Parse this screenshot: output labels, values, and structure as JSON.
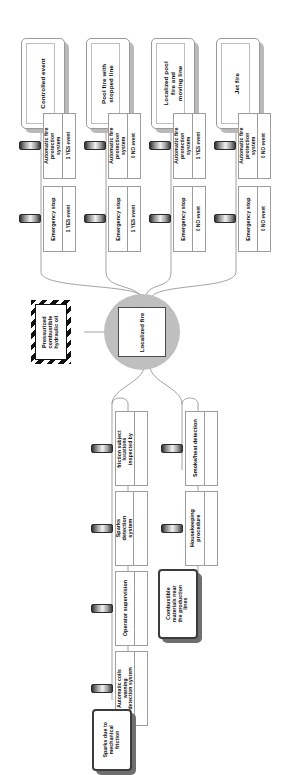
{
  "diagram": {
    "type": "bowtie-risk-diagram",
    "orientation": "rotated-90",
    "colors": {
      "top_event_circle": "#bfbfbf",
      "hazard_border": "#111111",
      "threat_fill": "#ffffff",
      "consequence_shadow": "#b9b9b9",
      "line": "#8a8a8a"
    }
  },
  "hazard": {
    "label": "Pressurized combustible hydraulic oil"
  },
  "top_event": {
    "label": "Localized fire"
  },
  "threats": [
    {
      "label": "Combustible materials near the production lines"
    },
    {
      "label": "Sparks due to mechanical friction"
    }
  ],
  "preventive_barriers": [
    {
      "label": "Mechanical friction subject locations inspected by operator"
    },
    {
      "label": "Smoke/heat detection"
    },
    {
      "label": "Sparks detection system"
    },
    {
      "label": "Housekeeping procedure"
    },
    {
      "label": "Operator supervision"
    },
    {
      "label": "Automatic coils warning detection system"
    }
  ],
  "consequences": [
    {
      "label": "Controlled event"
    },
    {
      "label": "Pool fire with stopped line"
    },
    {
      "label": "Localized pool fire and moving line"
    },
    {
      "label": "Jet fire"
    }
  ],
  "mitigative_barriers": [
    {
      "label": "Automatic fire protection system",
      "outcome": "1 YES event"
    },
    {
      "label": "Automatic fire protection system",
      "outcome": "0 NO event"
    },
    {
      "label": "Automatic fire protection system",
      "outcome": "1 YES event"
    },
    {
      "label": "Automatic fire protection system",
      "outcome": "0 NO event"
    },
    {
      "label": "Emergency stop",
      "outcome": "1 YES event"
    },
    {
      "label": "Emergency stop",
      "outcome": "1 YES event"
    },
    {
      "label": "Emergency stop",
      "outcome": "0 NO event"
    },
    {
      "label": "Emergency stop",
      "outcome": "0 NO event"
    }
  ]
}
